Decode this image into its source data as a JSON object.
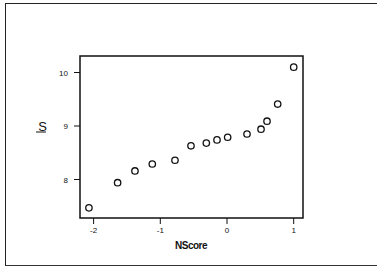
{
  "chart_data": {
    "type": "scatter",
    "title": "",
    "xlabel": "NScore",
    "ylabel": "S",
    "xlim": [
      -2.2,
      1.15
    ],
    "ylim": [
      7.35,
      10.3
    ],
    "xticks": [
      -2,
      -1,
      0,
      1
    ],
    "yticks": [
      8,
      9,
      10
    ],
    "grid": false,
    "legend": null,
    "marker": "open-circle",
    "series": [
      {
        "name": "S vs NScore",
        "x": [
          -2.07,
          -1.64,
          -1.38,
          -1.12,
          -0.78,
          -0.54,
          -0.31,
          -0.15,
          0.01,
          0.3,
          0.51,
          0.6,
          0.76,
          1.0
        ],
        "y": [
          7.47,
          7.94,
          8.16,
          8.29,
          8.36,
          8.63,
          8.68,
          8.74,
          8.79,
          8.85,
          8.94,
          9.09,
          9.41,
          10.1
        ]
      }
    ]
  },
  "labels": {
    "xlabel": "NScore",
    "ylabel": "S",
    "xticks": [
      "-2",
      "-1",
      "0",
      "1"
    ],
    "yticks": [
      "10",
      "9",
      "8"
    ]
  }
}
